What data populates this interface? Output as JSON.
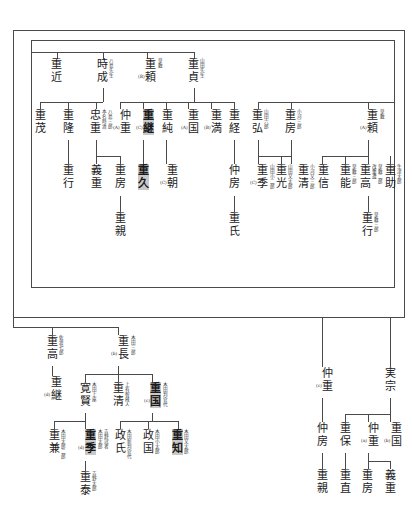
{
  "document": {
    "type": "genealogy-chart",
    "script": "vertical-japanese",
    "title": "山田氏系図",
    "background_color": "#ffffff",
    "line_color": "#4a4a4a",
    "highlight_color": "#c9c9c9"
  },
  "generations": {
    "g1": {
      "label": "第一世代",
      "nodes": [
        {
          "id": "n_shigechika",
          "name": "重近",
          "annotations": [],
          "prefix": "",
          "highlight": false
        },
        {
          "id": "n_tokinari",
          "name": "時成",
          "annotations": [
            "八島先生"
          ],
          "prefix": "",
          "highlight": false
        },
        {
          "id": "n_shigeyori_b",
          "name": "重頼",
          "annotations": [
            "草敷"
          ],
          "prefix": "(B)",
          "highlight": false
        },
        {
          "id": "n_shigesada",
          "name": "重貞",
          "annotations": [
            "山田先生"
          ],
          "prefix": "",
          "highlight": false
        }
      ]
    },
    "g2": {
      "label": "第二世代",
      "nodes": [
        {
          "id": "n_shigemochi",
          "name": "重茂",
          "annotations": [],
          "prefix": "",
          "highlight": false
        },
        {
          "id": "n_shigetaka",
          "name": "重隆",
          "annotations": [],
          "prefix": "",
          "highlight": false
        },
        {
          "id": "n_tadashige",
          "name": "忠重",
          "annotations": [
            "八島三郎",
            "本名時清"
          ],
          "prefix": "",
          "highlight": false
        },
        {
          "id": "n_nakashige_a",
          "name": "仲重",
          "annotations": [],
          "prefix": "(A)",
          "highlight": false
        },
        {
          "id": "n_shigetsugu_c",
          "name": "重継",
          "annotations": [],
          "prefix": "(C)",
          "highlight": true
        },
        {
          "id": "n_shigesumi",
          "name": "重純",
          "annotations": [],
          "prefix": "",
          "highlight": false
        },
        {
          "id": "n_shigekuni_a",
          "name": "重国",
          "annotations": [],
          "prefix": "(A)",
          "highlight": false
        },
        {
          "id": "n_shigemitsu",
          "name": "重満",
          "annotations": [],
          "prefix": "(B)",
          "highlight": false
        },
        {
          "id": "n_shigetsune",
          "name": "重経",
          "annotations": [],
          "prefix": "",
          "highlight": false
        },
        {
          "id": "n_shigehiro",
          "name": "重弘",
          "annotations": [
            "山田六郎"
          ],
          "prefix": "",
          "highlight": false
        },
        {
          "id": "n_shigefusa",
          "name": "重房",
          "annotations": [
            "小河三郎"
          ],
          "prefix": "",
          "highlight": false
        },
        {
          "id": "n_shigeyori_a",
          "name": "重頼",
          "annotations": [
            "草敷"
          ],
          "prefix": "(A)",
          "highlight": false
        }
      ]
    },
    "g3": {
      "label": "第三世代",
      "nodes": [
        {
          "id": "n_shigeyuki",
          "name": "重行",
          "annotations": [],
          "prefix": "",
          "highlight": false
        },
        {
          "id": "n_yoshishige",
          "name": "義重",
          "annotations": [],
          "prefix": "",
          "highlight": false
        },
        {
          "id": "n_shigefusa2",
          "name": "重房",
          "annotations": [],
          "prefix": "",
          "highlight": false
        },
        {
          "id": "n_shigehisa",
          "name": "重久",
          "annotations": [],
          "prefix": "",
          "highlight": true
        },
        {
          "id": "n_shigetomo_c",
          "name": "重朝",
          "annotations": [],
          "prefix": "(C)",
          "highlight": false
        },
        {
          "id": "n_nakafusa",
          "name": "仲房",
          "annotations": [],
          "prefix": "",
          "highlight": false
        },
        {
          "id": "n_shigesue_c",
          "name": "重季",
          "annotations": [
            "山田小二郎"
          ],
          "prefix": "(C)",
          "highlight": false
        },
        {
          "id": "n_shigemitsu2",
          "name": "重光",
          "annotations": [
            "山田又太郎"
          ],
          "prefix": "",
          "highlight": false
        },
        {
          "id": "n_shigekiyo",
          "name": "重清",
          "annotations": [
            "小河又三郎"
          ],
          "prefix": "",
          "highlight": false
        },
        {
          "id": "n_shigenobu",
          "name": "重信",
          "annotations": [],
          "prefix": "",
          "highlight": false
        },
        {
          "id": "n_shigeyoshi",
          "name": "重能",
          "annotations": [
            "草敷三郎"
          ],
          "prefix": "",
          "highlight": false
        },
        {
          "id": "n_shigetaka2",
          "name": "重高",
          "annotations": [
            "草敷二郎",
            "改重遭"
          ],
          "prefix": "",
          "highlight": false
        },
        {
          "id": "n_shigesuke",
          "name": "重助",
          "annotations": [
            "生津太郎"
          ],
          "prefix": "",
          "highlight": false
        }
      ]
    },
    "g4": {
      "label": "第四世代",
      "nodes": [
        {
          "id": "n_shigechika2",
          "name": "重親",
          "annotations": [],
          "prefix": "",
          "highlight": false
        },
        {
          "id": "n_shigeuji",
          "name": "重氏",
          "annotations": [],
          "prefix": "",
          "highlight": false
        },
        {
          "id": "n_shigeyuki2",
          "name": "重行",
          "annotations": [
            "草敷三郎"
          ],
          "prefix": "",
          "highlight": false
        }
      ]
    },
    "lower_left": {
      "label": "下段左系",
      "nodes": [
        {
          "id": "n_shigetaka_sado",
          "name": "重高",
          "annotations": [
            "佐渡七郎"
          ],
          "prefix": "",
          "highlight": false
        },
        {
          "id": "n_shigetsugu_d",
          "name": "重継",
          "annotations": [],
          "prefix": "(d)",
          "highlight": false
        },
        {
          "id": "n_shigenaga_b",
          "name": "重長",
          "annotations": [
            "木田三郎"
          ],
          "prefix": "(b)",
          "highlight": false
        },
        {
          "id": "n_kanken",
          "name": "寛賢",
          "annotations": [
            "木田上座"
          ],
          "prefix": "",
          "highlight": false
        },
        {
          "id": "n_shigekiyo2",
          "name": "重清",
          "annotations": [
            "上有智蔵人"
          ],
          "prefix": "",
          "highlight": false
        },
        {
          "id": "n_shigekuni_c",
          "name": "重国",
          "annotations": [
            "木田判官代"
          ],
          "prefix": "(c)",
          "highlight": true
        },
        {
          "id": "n_shigekane",
          "name": "重兼",
          "annotations": [
            "木田太郎二郎"
          ],
          "prefix": "",
          "highlight": false
        },
        {
          "id": "n_shigesue_d",
          "name": "重季",
          "annotations": [
            "吉野冠者",
            "木田太郎"
          ],
          "prefix": "(d)",
          "highlight": true
        },
        {
          "id": "n_masauji",
          "name": "政氏",
          "annotations": [
            "木田新判官代"
          ],
          "prefix": "",
          "highlight": false
        },
        {
          "id": "n_masakuni",
          "name": "政国",
          "annotations": [
            "木田小太郎"
          ],
          "prefix": "",
          "highlight": false
        },
        {
          "id": "n_shigetomo2",
          "name": "重知",
          "annotations": [
            "木田又太郎"
          ],
          "prefix": "",
          "highlight": true
        },
        {
          "id": "n_shigeyasu",
          "name": "重泰",
          "annotations": [
            "吉野太郎"
          ],
          "prefix": "",
          "highlight": false
        }
      ]
    },
    "lower_right": {
      "label": "下段右系",
      "nodes": [
        {
          "id": "n_nakashige_c",
          "name": "仲重",
          "annotations": [],
          "prefix": "(c)",
          "highlight": false
        },
        {
          "id": "n_sanemune",
          "name": "実宗",
          "annotations": [],
          "prefix": "",
          "highlight": false
        },
        {
          "id": "n_nakafusa2",
          "name": "仲房",
          "annotations": [],
          "prefix": "",
          "highlight": false
        },
        {
          "id": "n_shigeyasu2",
          "name": "重保",
          "annotations": [],
          "prefix": "",
          "highlight": false
        },
        {
          "id": "n_nakashige_a2",
          "name": "仲重",
          "annotations": [],
          "prefix": "(a)",
          "highlight": false
        },
        {
          "id": "n_shigekuni_b",
          "name": "重国",
          "annotations": [],
          "prefix": "(b)",
          "highlight": false
        },
        {
          "id": "n_shigechika3",
          "name": "重親",
          "annotations": [],
          "prefix": "",
          "highlight": false
        },
        {
          "id": "n_shigenao",
          "name": "重直",
          "annotations": [],
          "prefix": "",
          "highlight": false
        },
        {
          "id": "n_shigefusa3",
          "name": "重房",
          "annotations": [],
          "prefix": "",
          "highlight": false
        },
        {
          "id": "n_yoshishige2",
          "name": "義重",
          "annotations": [],
          "prefix": "",
          "highlight": false
        }
      ]
    }
  }
}
